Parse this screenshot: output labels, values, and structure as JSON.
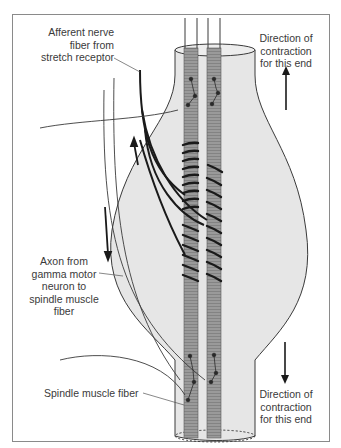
{
  "diagram": {
    "labels": {
      "afferent": [
        "Afferent nerve",
        "fiber from",
        "stretch receptor"
      ],
      "gamma_axon": [
        "Axon from",
        "gamma motor",
        "neuron to",
        "spindle muscle",
        "fiber"
      ],
      "spindle_fiber": [
        "Spindle muscle fiber"
      ],
      "direction_top": [
        "Direction of",
        "contraction",
        "for this end"
      ],
      "direction_bottom": [
        "Direction of",
        "contraction",
        "for this end"
      ]
    },
    "arrows": {
      "top_direction": "up",
      "bottom_direction": "down"
    },
    "colors": {
      "capsule_fill": "#e6e6e6",
      "capsule_stroke": "#3a3a3a",
      "fiber_fill": "#9a9a9a",
      "fiber_stripe": "#7a7a7a",
      "nerve": "#1a1a1a",
      "frame": "#8a8a8a"
    }
  }
}
